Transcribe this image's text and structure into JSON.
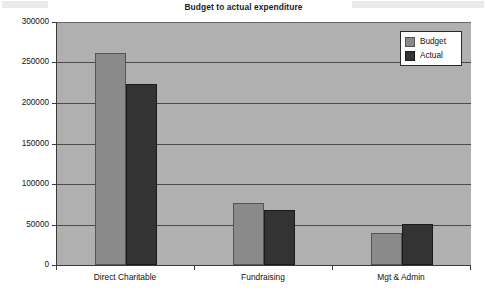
{
  "chart_data": {
    "type": "bar",
    "title": "Budget to actual expenditure",
    "xlabel": "",
    "ylabel": "",
    "categories": [
      "Direct Charitable",
      "Fundraising",
      "Mgt & Admin"
    ],
    "series": [
      {
        "name": "Budget",
        "color": "#8a8a8a",
        "values": [
          262000,
          76000,
          39000
        ]
      },
      {
        "name": "Actual",
        "color": "#333333",
        "values": [
          224000,
          68000,
          51000
        ]
      }
    ],
    "ylim": [
      0,
      300000
    ],
    "ytick_labels": [
      "300000",
      "250000",
      "200000",
      "150000",
      "100000",
      "50000",
      "0"
    ],
    "ytick_values": [
      300000,
      250000,
      200000,
      150000,
      100000,
      50000,
      0
    ],
    "grid": true,
    "legend_position": "top-right",
    "plot_background": "#b0b0b0",
    "page_background": "#ffffff"
  },
  "legend": {
    "entries": [
      {
        "label": "Budget"
      },
      {
        "label": "Actual"
      }
    ]
  }
}
